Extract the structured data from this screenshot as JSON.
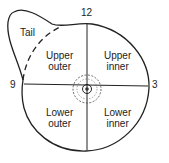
{
  "diagram": {
    "clock_labels": {
      "top": "12",
      "left": "9",
      "right": "3"
    },
    "regions": {
      "tail": "Tail",
      "upper_outer": [
        "Upper",
        "outer"
      ],
      "upper_inner": [
        "Upper",
        "inner"
      ],
      "lower_outer": [
        "Lower",
        "outer"
      ],
      "lower_inner": [
        "Lower",
        "inner"
      ]
    },
    "colors": {
      "stroke": "#222222",
      "background": "#ffffff"
    }
  }
}
